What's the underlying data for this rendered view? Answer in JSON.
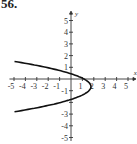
{
  "problem_label": "56.",
  "chart_data": {
    "type": "line",
    "title": "",
    "xlabel": "x",
    "ylabel": "y",
    "xlim": [
      -5,
      5
    ],
    "ylim": [
      -5,
      5
    ],
    "x_ticks": [
      "-5",
      "-4",
      "-3",
      "-2",
      "-1",
      "1",
      "2",
      "3",
      "4",
      "5"
    ],
    "y_ticks": [
      "5",
      "4",
      "3",
      "2",
      "1",
      "-1",
      "-3",
      "-4",
      "-5"
    ],
    "grid": false,
    "series": [
      {
        "name": "parabola opening left",
        "vertex": [
          1.75,
          -0.65
        ],
        "points": [
          [
            -5.3,
            1.5
          ],
          [
            -3,
            1.0
          ],
          [
            -1,
            0.55
          ],
          [
            0,
            0.4
          ],
          [
            1.3,
            0
          ],
          [
            1.75,
            -0.65
          ],
          [
            1.3,
            -1.2
          ],
          [
            0,
            -1.7
          ],
          [
            -1,
            -2.0
          ],
          [
            -3,
            -2.45
          ],
          [
            -5.3,
            -2.8
          ]
        ]
      }
    ]
  }
}
